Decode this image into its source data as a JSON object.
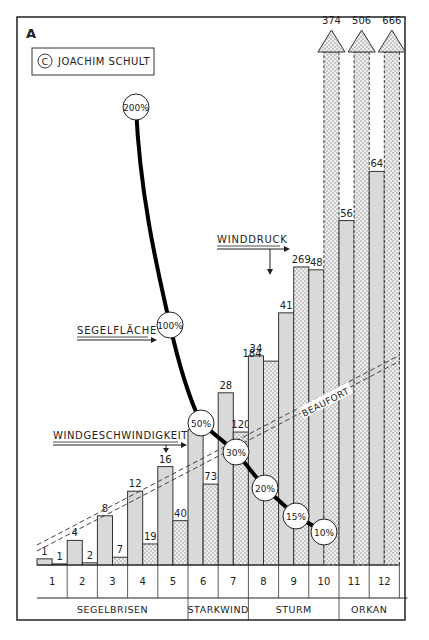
{
  "panel_letter": "A",
  "copyright": {
    "symbol": "C",
    "author": "JOACHIM SCHULT"
  },
  "chart_data": {
    "type": "bar",
    "title": "",
    "xlabel": "Beaufort",
    "categories": [
      "1",
      "2",
      "3",
      "4",
      "5",
      "6",
      "7",
      "8",
      "9",
      "10",
      "11",
      "12"
    ],
    "series": [
      {
        "name": "Windgeschwindigkeit",
        "values": [
          1,
          4,
          8,
          12,
          16,
          22,
          28,
          34,
          41,
          48,
          56,
          64
        ],
        "style": "solid-gray"
      },
      {
        "name": "Winddruck",
        "values": [
          1,
          2,
          7,
          19,
          40,
          73,
          120,
          184,
          269,
          374,
          506,
          666
        ],
        "style": "dotted",
        "overflow_from": "10"
      }
    ],
    "sail_area_curve": {
      "name": "Segelfläche",
      "points": [
        {
          "label": "200%"
        },
        {
          "label": "100%"
        },
        {
          "beaufort": "6",
          "label": "50%"
        },
        {
          "beaufort": "7",
          "label": "30%"
        },
        {
          "beaufort": "8",
          "label": "20%"
        },
        {
          "beaufort": "9",
          "label": "15%"
        },
        {
          "beaufort": "10",
          "label": "10%"
        }
      ]
    },
    "annotations": {
      "winddruck": "WINDDRUCK",
      "segelflaeche": "SEGELFLÄCHE",
      "windgeschwindigkeit": "WINDGESCHWINDIGKEIT",
      "beaufort": "BEAUFORT"
    },
    "groups": [
      {
        "label": "SEGELBRISEN",
        "from": "1",
        "to": "5"
      },
      {
        "label": "STARKWIND",
        "from": "6",
        "to": "7"
      },
      {
        "label": "STURM",
        "from": "8",
        "to": "10"
      },
      {
        "label": "ORKAN",
        "from": "11",
        "to": "12"
      }
    ]
  }
}
